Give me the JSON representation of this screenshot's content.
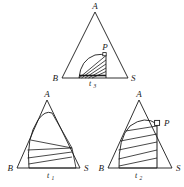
{
  "figure": {
    "background_color": "#ffffff",
    "stroke_color": "#1a1a1a",
    "label_color": "#1a1a1a",
    "panels": [
      {
        "id": "top",
        "name": "triangle-t3",
        "vertex_a": "A",
        "vertex_b": "B",
        "vertex_s": "S",
        "point_p": "P",
        "base_label": "t",
        "base_label_sub": "3",
        "hatch_line_count": 6,
        "has_arc": true,
        "has_vertical_to_p": true,
        "has_angle_marker": true
      },
      {
        "id": "bottom-left",
        "name": "triangle-t1",
        "vertex_a": "A",
        "vertex_b": "B",
        "vertex_s": "S",
        "point_p": "",
        "base_label": "t",
        "base_label_sub": "1",
        "hatch_line_count": 5,
        "has_arc": true,
        "has_vertical_to_p": false,
        "has_angle_marker": false
      },
      {
        "id": "bottom-right",
        "name": "triangle-t2",
        "vertex_a": "A",
        "vertex_b": "B",
        "vertex_s": "S",
        "point_p": "P",
        "base_label": "t",
        "base_label_sub": "2",
        "hatch_line_count": 5,
        "has_arc": true,
        "has_vertical_to_p": true,
        "has_angle_marker": true
      }
    ]
  }
}
